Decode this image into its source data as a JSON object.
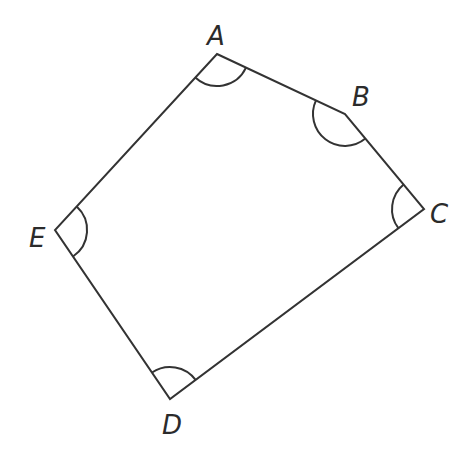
{
  "diagram": {
    "type": "pentagon-with-angle-markers",
    "vertices": [
      {
        "label": "A",
        "x": 217,
        "y": 54,
        "label_x": 209,
        "label_y": 45
      },
      {
        "label": "B",
        "x": 345,
        "y": 114,
        "label_x": 353,
        "label_y": 105
      },
      {
        "label": "C",
        "x": 424,
        "y": 209,
        "label_x": 431,
        "label_y": 223
      },
      {
        "label": "D",
        "x": 170,
        "y": 399,
        "label_x": 163,
        "label_y": 434
      },
      {
        "label": "E",
        "x": 55,
        "y": 230,
        "label_x": 30,
        "label_y": 247
      }
    ],
    "edges": [
      [
        "A",
        "B"
      ],
      [
        "B",
        "C"
      ],
      [
        "C",
        "D"
      ],
      [
        "D",
        "E"
      ],
      [
        "E",
        "A"
      ]
    ],
    "angle_markers": [
      "A",
      "B",
      "C",
      "D",
      "E"
    ],
    "colors": {
      "stroke": "#333333",
      "label": "#2b2b2b",
      "background": "#ffffff"
    }
  }
}
